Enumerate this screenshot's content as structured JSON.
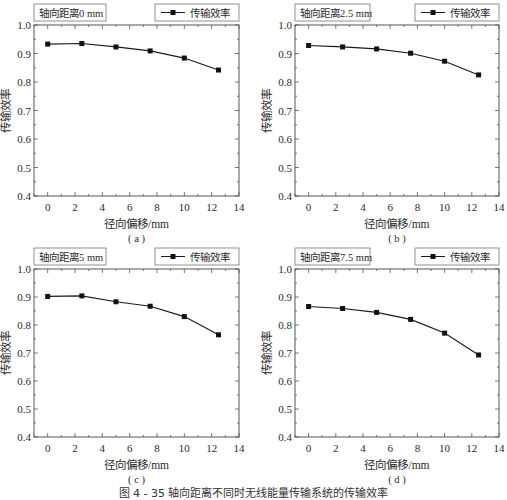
{
  "figure_caption": "图 4 - 35  轴向距离不同时无线能量传输系统的传输效率",
  "chart_data": [
    {
      "type": "line",
      "panel_label": "( a )",
      "annotation": "轴向距离0 mm",
      "legend": [
        "传输效率"
      ],
      "legend_position": "top-right",
      "xlabel": "径向偏移/mm",
      "ylabel": "传输效率",
      "xlim": [
        -1,
        14
      ],
      "ylim": [
        0.4,
        1.0
      ],
      "xticks": [
        0,
        2,
        4,
        6,
        8,
        10,
        12,
        14
      ],
      "yticks": [
        0.4,
        0.5,
        0.6,
        0.7,
        0.8,
        0.9,
        1.0
      ],
      "grid": false,
      "series": [
        {
          "name": "传输效率",
          "x": [
            0,
            2.5,
            5,
            7.5,
            10,
            12.5
          ],
          "values": [
            0.933,
            0.935,
            0.923,
            0.909,
            0.884,
            0.842
          ]
        }
      ]
    },
    {
      "type": "line",
      "panel_label": "( b )",
      "annotation": "轴向距离2.5 mm",
      "legend": [
        "传输效率"
      ],
      "legend_position": "top-right",
      "xlabel": "径向偏移/mm",
      "ylabel": "传输效率",
      "xlim": [
        -1,
        14
      ],
      "ylim": [
        0.4,
        1.0
      ],
      "xticks": [
        0,
        2,
        4,
        6,
        8,
        10,
        12,
        14
      ],
      "yticks": [
        0.4,
        0.5,
        0.6,
        0.7,
        0.8,
        0.9,
        1.0
      ],
      "grid": false,
      "series": [
        {
          "name": "传输效率",
          "x": [
            0,
            2.5,
            5,
            7.5,
            10,
            12.5
          ],
          "values": [
            0.928,
            0.923,
            0.916,
            0.901,
            0.873,
            0.825
          ]
        }
      ]
    },
    {
      "type": "line",
      "panel_label": "( c )",
      "annotation": "轴向距离5 mm",
      "legend": [
        "传输效率"
      ],
      "legend_position": "top-right",
      "xlabel": "径向偏移/mm",
      "ylabel": "传输效率",
      "xlim": [
        -1,
        14
      ],
      "ylim": [
        0.4,
        1.0
      ],
      "xticks": [
        0,
        2,
        4,
        6,
        8,
        10,
        12,
        14
      ],
      "yticks": [
        0.4,
        0.5,
        0.6,
        0.7,
        0.8,
        0.9,
        1.0
      ],
      "grid": false,
      "series": [
        {
          "name": "传输效率",
          "x": [
            0,
            2.5,
            5,
            7.5,
            10,
            12.5
          ],
          "values": [
            0.902,
            0.904,
            0.883,
            0.867,
            0.83,
            0.765
          ]
        }
      ]
    },
    {
      "type": "line",
      "panel_label": "( d )",
      "annotation": "轴向距离7.5 mm",
      "legend": [
        "传输效率"
      ],
      "legend_position": "top-right",
      "xlabel": "径向偏移/mm",
      "ylabel": "传输效率",
      "xlim": [
        -1,
        14
      ],
      "ylim": [
        0.4,
        1.0
      ],
      "xticks": [
        0,
        2,
        4,
        6,
        8,
        10,
        12,
        14
      ],
      "yticks": [
        0.4,
        0.5,
        0.6,
        0.7,
        0.8,
        0.9,
        1.0
      ],
      "grid": false,
      "series": [
        {
          "name": "传输效率",
          "x": [
            0,
            2.5,
            5,
            7.5,
            10,
            12.5
          ],
          "values": [
            0.866,
            0.859,
            0.845,
            0.82,
            0.771,
            0.693
          ]
        }
      ]
    }
  ],
  "style": {
    "line_color": "#1a1a1a",
    "marker_color": "#111111",
    "frame_color": "#555555",
    "box_border": "#777777"
  }
}
